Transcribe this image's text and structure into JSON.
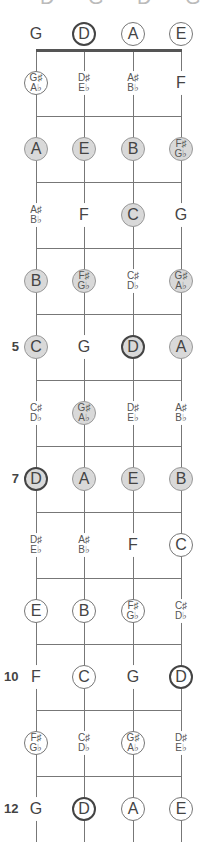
{
  "title": "D G D G B D",
  "strings": [
    "G",
    "D",
    "A",
    "E"
  ],
  "string_x": [
    36,
    84,
    133,
    181
  ],
  "colors": {
    "filled": "#d9d9d9",
    "line": "#777777",
    "root_border": "#444444"
  },
  "fret_markers": [
    {
      "fret": 5,
      "label": "5"
    },
    {
      "fret": 7,
      "label": "7"
    },
    {
      "fret": 10,
      "label": "10"
    },
    {
      "fret": 12,
      "label": "12"
    }
  ],
  "rows": [
    {
      "fret": 0,
      "notes": [
        {
          "t": "G",
          "s": "plain"
        },
        {
          "t": "D",
          "s": "root"
        },
        {
          "t": "A",
          "s": "outline"
        },
        {
          "t": "E",
          "s": "outline"
        }
      ]
    },
    {
      "fret": 1,
      "notes": [
        {
          "t": "G♯",
          "b": "A♭",
          "s": "outline"
        },
        {
          "t": "D♯",
          "b": "E♭",
          "s": "plain"
        },
        {
          "t": "A♯",
          "b": "B♭",
          "s": "plain"
        },
        {
          "t": "F",
          "s": "plain"
        }
      ]
    },
    {
      "fret": 2,
      "notes": [
        {
          "t": "A",
          "s": "filled"
        },
        {
          "t": "E",
          "s": "filled"
        },
        {
          "t": "B",
          "s": "filled"
        },
        {
          "t": "F♯",
          "b": "G♭",
          "s": "filled"
        }
      ]
    },
    {
      "fret": 3,
      "notes": [
        {
          "t": "A♯",
          "b": "B♭",
          "s": "plain"
        },
        {
          "t": "F",
          "s": "plain"
        },
        {
          "t": "C",
          "s": "filled"
        },
        {
          "t": "G",
          "s": "plain"
        }
      ]
    },
    {
      "fret": 4,
      "notes": [
        {
          "t": "B",
          "s": "filled"
        },
        {
          "t": "F♯",
          "b": "G♭",
          "s": "filled"
        },
        {
          "t": "C♯",
          "b": "D♭",
          "s": "plain"
        },
        {
          "t": "G♯",
          "b": "A♭",
          "s": "filled"
        }
      ]
    },
    {
      "fret": 5,
      "notes": [
        {
          "t": "C",
          "s": "filled"
        },
        {
          "t": "G",
          "s": "plain"
        },
        {
          "t": "D",
          "s": "filled root"
        },
        {
          "t": "A",
          "s": "filled"
        }
      ]
    },
    {
      "fret": 6,
      "notes": [
        {
          "t": "C♯",
          "b": "D♭",
          "s": "plain"
        },
        {
          "t": "G♯",
          "b": "A♭",
          "s": "filled"
        },
        {
          "t": "D♯",
          "b": "E♭",
          "s": "plain"
        },
        {
          "t": "A♯",
          "b": "B♭",
          "s": "plain"
        }
      ]
    },
    {
      "fret": 7,
      "notes": [
        {
          "t": "D",
          "s": "filled root"
        },
        {
          "t": "A",
          "s": "filled"
        },
        {
          "t": "E",
          "s": "filled"
        },
        {
          "t": "B",
          "s": "filled"
        }
      ]
    },
    {
      "fret": 8,
      "notes": [
        {
          "t": "D♯",
          "b": "E♭",
          "s": "plain"
        },
        {
          "t": "A♯",
          "b": "B♭",
          "s": "plain"
        },
        {
          "t": "F",
          "s": "plain"
        },
        {
          "t": "C",
          "s": "outline"
        }
      ]
    },
    {
      "fret": 9,
      "notes": [
        {
          "t": "E",
          "s": "outline"
        },
        {
          "t": "B",
          "s": "outline"
        },
        {
          "t": "F♯",
          "b": "G♭",
          "s": "outline"
        },
        {
          "t": "C♯",
          "b": "D♭",
          "s": "plain"
        }
      ]
    },
    {
      "fret": 10,
      "notes": [
        {
          "t": "F",
          "s": "plain"
        },
        {
          "t": "C",
          "s": "outline"
        },
        {
          "t": "G",
          "s": "plain"
        },
        {
          "t": "D",
          "s": "root"
        }
      ]
    },
    {
      "fret": 11,
      "notes": [
        {
          "t": "F♯",
          "b": "G♭",
          "s": "outline"
        },
        {
          "t": "C♯",
          "b": "D♭",
          "s": "plain"
        },
        {
          "t": "G♯",
          "b": "A♭",
          "s": "outline"
        },
        {
          "t": "D♯",
          "b": "E♭",
          "s": "plain"
        }
      ]
    },
    {
      "fret": 12,
      "notes": [
        {
          "t": "G",
          "s": "plain"
        },
        {
          "t": "D",
          "s": "root"
        },
        {
          "t": "A",
          "s": "outline"
        },
        {
          "t": "E",
          "s": "outline"
        }
      ]
    }
  ]
}
